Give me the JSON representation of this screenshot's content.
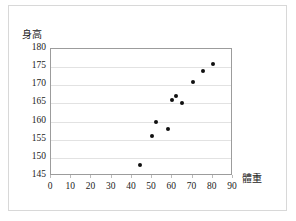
{
  "chart_data": {
    "type": "scatter",
    "title": "",
    "xlabel": "體重",
    "ylabel": "身高",
    "xlim": [
      0,
      90
    ],
    "ylim": [
      145,
      180
    ],
    "xticks": [
      0,
      10,
      20,
      30,
      40,
      50,
      60,
      70,
      80,
      90
    ],
    "yticks": [
      145,
      150,
      155,
      160,
      165,
      170,
      175,
      180
    ],
    "grid": "horizontal",
    "legend": "none",
    "marker_color": "#101010",
    "series": [
      {
        "name": "身高對體重",
        "points": [
          {
            "x": 44,
            "y": 148
          },
          {
            "x": 50,
            "y": 156
          },
          {
            "x": 52,
            "y": 160
          },
          {
            "x": 58,
            "y": 158
          },
          {
            "x": 60,
            "y": 166
          },
          {
            "x": 62,
            "y": 167
          },
          {
            "x": 65,
            "y": 165
          },
          {
            "x": 70,
            "y": 171
          },
          {
            "x": 75,
            "y": 174
          },
          {
            "x": 80,
            "y": 176
          }
        ]
      }
    ]
  },
  "axes": {
    "y_title": "身高",
    "x_title": "體重"
  },
  "colors": {
    "marker": "#101010",
    "gridline": "#e2e2e2",
    "plot_border": "#9c9c9c",
    "page_border": "#d8d8d8",
    "tick_text": "#222222"
  }
}
